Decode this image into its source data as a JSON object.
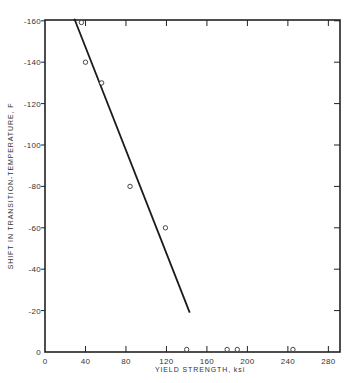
{
  "chart_data": {
    "type": "scatter",
    "title": "",
    "xlabel": "YIELD STRENGTH, ksi",
    "ylabel": "SHIFT IN TRANSITION-TEMPERATURE, F",
    "xlim": [
      0,
      292
    ],
    "ylim": [
      0,
      -162
    ],
    "x_ticks": [
      0,
      40,
      80,
      120,
      160,
      200,
      240,
      280
    ],
    "x_tick_labels": [
      "0",
      "40",
      "80",
      "120",
      "160",
      "200",
      "240",
      "280"
    ],
    "y_ticks": [
      0,
      -20,
      -40,
      -60,
      -80,
      -100,
      -120,
      -140,
      -160
    ],
    "y_tick_labels": [
      "0",
      "-20",
      "-40",
      "-60",
      "-80",
      "-100",
      "-120",
      "-140",
      "-160"
    ],
    "grid": false,
    "legend": null,
    "series": [
      {
        "name": "Data points",
        "marker": "open-circle",
        "points": [
          {
            "x": 36,
            "y": -160
          },
          {
            "x": 40,
            "y": -140
          },
          {
            "x": 56,
            "y": -130
          },
          {
            "x": 84,
            "y": -80
          },
          {
            "x": 119,
            "y": -60
          },
          {
            "x": 140,
            "y": 0
          },
          {
            "x": 180,
            "y": 0
          },
          {
            "x": 190,
            "y": 0
          },
          {
            "x": 245,
            "y": 0
          }
        ]
      },
      {
        "name": "Trend line",
        "type": "line",
        "points": [
          {
            "x": 29,
            "y": -161
          },
          {
            "x": 143,
            "y": -19
          }
        ]
      }
    ]
  }
}
